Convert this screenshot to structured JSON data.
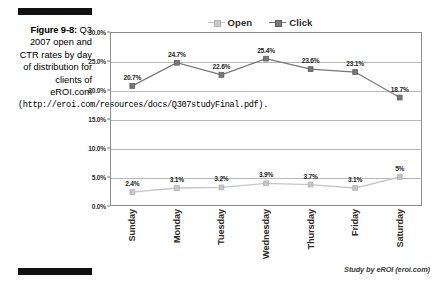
{
  "caption": {
    "figure_label": "Figure 9-8:",
    "description": "Q3 2007 open and CTR rates by day of distribution for clients of eROI.com",
    "url_text": "(http://eroi.com/resources/docs/Q307studyFinal.pdf)."
  },
  "source_note": "Study by eROI (eroi.com)",
  "chart_data": {
    "type": "line",
    "title": "",
    "xlabel": "",
    "ylabel": "",
    "categories": [
      "Sunday",
      "Monday",
      "Tuesday",
      "Wednesday",
      "Thursday",
      "Friday",
      "Saturday"
    ],
    "series": [
      {
        "name": "Open",
        "color": "#787878",
        "values": [
          20.7,
          24.7,
          22.6,
          25.4,
          23.6,
          23.1,
          18.7
        ],
        "labels": [
          "20.7%",
          "24.7%",
          "22.6%",
          "25.4%",
          "23.6%",
          "23.1%",
          "18.7%"
        ]
      },
      {
        "name": "Click",
        "color": "#c6c6c6",
        "values": [
          2.4,
          3.1,
          3.2,
          3.9,
          3.7,
          3.1,
          5.0
        ],
        "labels": [
          "2.4%",
          "3.1%",
          "3.2%",
          "3.9%",
          "3.7%",
          "3.1%",
          "5%"
        ]
      }
    ],
    "ylim": [
      0,
      30
    ],
    "yticks": [
      0,
      5,
      10,
      15,
      20,
      25,
      30
    ],
    "ytick_labels": [
      "0.0%",
      "5.0%",
      "10.0%",
      "15.0%",
      "20.0%",
      "25.0%",
      "30.0%"
    ],
    "grid": true,
    "legend_position": "top-center",
    "legend_entries": [
      "Open",
      "Click"
    ]
  }
}
